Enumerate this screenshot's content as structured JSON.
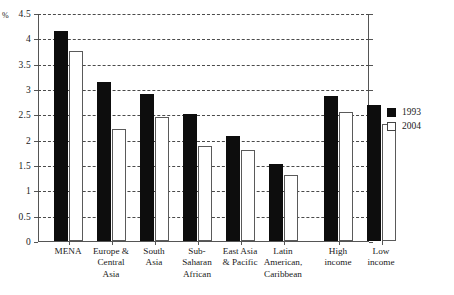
{
  "chart_data": {
    "type": "bar",
    "title": "",
    "subtitle": "",
    "xlabel": "",
    "ylabel": "%",
    "unit_symbol": "%",
    "ylim": [
      0,
      4.5
    ],
    "ytick_step": 0.5,
    "yticks": [
      "0",
      "0.5",
      "1",
      "1.5",
      "2",
      "2.5",
      "3",
      "3.5",
      "4",
      "4.5"
    ],
    "grid": true,
    "grid_style": "dashed-horizontal",
    "legend_position": "right",
    "categories": [
      "MENA",
      "Europe & Central Asia",
      "South Asia",
      "Sub-Saharan African",
      "East Asia & Pacific",
      "Latin American, Caribbean",
      "High income",
      "Low income"
    ],
    "category_lines": [
      [
        "MENA"
      ],
      [
        "Europe &",
        "Central",
        "Asia"
      ],
      [
        "South",
        "Asia"
      ],
      [
        "Sub-",
        "Saharan",
        "African"
      ],
      [
        "East Asia",
        "& Pacific"
      ],
      [
        "Latin",
        "American,",
        "Caribbean"
      ],
      [
        "High",
        "income"
      ],
      [
        "Low",
        "income"
      ]
    ],
    "series": [
      {
        "name": "1993",
        "color": "#0d0d0d",
        "fill": "solid-black",
        "values": [
          4.15,
          3.13,
          2.9,
          2.5,
          2.07,
          1.52,
          2.87,
          2.68
        ]
      },
      {
        "name": "2004",
        "color": "#ffffff",
        "fill": "white-outlined",
        "values": [
          3.75,
          2.22,
          2.45,
          1.87,
          1.8,
          1.3,
          2.55,
          2.3
        ]
      }
    ]
  },
  "legend": {
    "entries": [
      {
        "label": "1993",
        "swatch": "black-square-icon"
      },
      {
        "label": "2004",
        "swatch": "white-square-icon"
      }
    ]
  },
  "axis": {
    "y_unit_label": "%"
  }
}
